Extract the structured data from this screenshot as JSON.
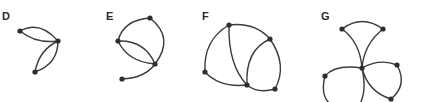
{
  "figure": {
    "type": "graph-diagrams",
    "panels": [
      {
        "id": "D",
        "label": "D",
        "node_count": 3,
        "edges": [
          [
            "n1",
            "n2"
          ],
          [
            "n1",
            "n2"
          ],
          [
            "n2",
            "n3"
          ],
          [
            "n2",
            "n3"
          ]
        ]
      },
      {
        "id": "E",
        "label": "E",
        "node_count": 4,
        "edges": [
          [
            "n1",
            "n2"
          ],
          [
            "n1",
            "n3"
          ],
          [
            "n2",
            "n3"
          ],
          [
            "n2",
            "n3"
          ],
          [
            "n3",
            "n4"
          ]
        ]
      },
      {
        "id": "F",
        "label": "F",
        "node_count": 5,
        "edges": [
          [
            "n1",
            "n2"
          ],
          [
            "n1",
            "n3"
          ],
          [
            "n1",
            "n4"
          ],
          [
            "n3",
            "n4"
          ],
          [
            "n2",
            "n4"
          ],
          [
            "n2",
            "n5"
          ],
          [
            "n4",
            "n5"
          ]
        ]
      },
      {
        "id": "G",
        "label": "G",
        "node_count": 6,
        "edges": [
          [
            "n1",
            "n2"
          ],
          [
            "n1",
            "c"
          ],
          [
            "n2",
            "c"
          ],
          [
            "c",
            "n3"
          ],
          [
            "n3",
            "c"
          ],
          [
            "c",
            "n4"
          ],
          [
            "n4",
            "n5"
          ],
          [
            "n5",
            "c"
          ]
        ]
      }
    ],
    "colors": {
      "ink": "#2e2e2e",
      "background": "#ffffff"
    }
  }
}
